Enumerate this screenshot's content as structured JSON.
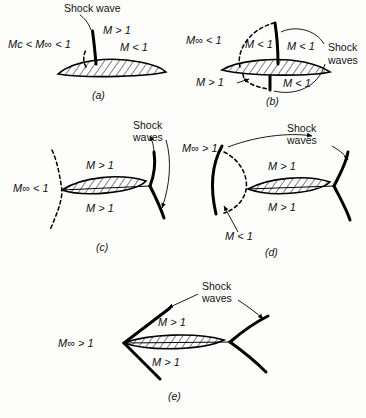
{
  "figure": {
    "background_color": "#fdfdfc",
    "ink_color": "#111111"
  },
  "panels": [
    {
      "id": "a",
      "caption": "(a)",
      "freestream_label": "Mᴄ < M∞ < 1",
      "annotations": [
        {
          "name": "shock-wave-label",
          "text": "Shock wave"
        },
        {
          "name": "supersonic-pocket-label",
          "text": "M > 1"
        },
        {
          "name": "subsonic-aft-label",
          "text": "M < 1"
        }
      ],
      "features": [
        "upper-surface-shock",
        "embedded-supersonic-pocket",
        "sonic-line"
      ]
    },
    {
      "id": "b",
      "caption": "(b)",
      "freestream_label": "M∞ < 1",
      "annotations": [
        {
          "name": "shock-waves-label",
          "text": "Shock waves"
        },
        {
          "name": "upper-pocket-label",
          "text": "M < 1"
        },
        {
          "name": "upper-aft-label",
          "text": "M < 1"
        },
        {
          "name": "lower-pocket-label",
          "text": "M > 1"
        },
        {
          "name": "lower-aft-label",
          "text": "M < 1"
        }
      ],
      "features": [
        "upper-surface-shock",
        "lower-surface-shock",
        "larger-supersonic-pockets",
        "sonic-line"
      ]
    },
    {
      "id": "c",
      "caption": "(c)",
      "freestream_label": "M∞ < 1",
      "annotations": [
        {
          "name": "shock-waves-label",
          "text": "Shock waves"
        },
        {
          "name": "upper-supersonic-label",
          "text": "M > 1"
        },
        {
          "name": "lower-supersonic-label",
          "text": "M > 1"
        }
      ],
      "features": [
        "trailing-edge-shocks",
        "detached-sonic-line-ahead",
        "fully-supersonic-surfaces"
      ]
    },
    {
      "id": "d",
      "caption": "(d)",
      "freestream_label": "M∞ > 1",
      "annotations": [
        {
          "name": "shock-waves-label",
          "text": "Shock waves"
        },
        {
          "name": "upper-supersonic-label",
          "text": "M > 1"
        },
        {
          "name": "lower-supersonic-label",
          "text": "M > 1"
        },
        {
          "name": "subsonic-pocket-label",
          "text": "M < 1"
        }
      ],
      "features": [
        "detached-bow-shock",
        "subsonic-nose-region",
        "trailing-edge-shocks",
        "sonic-line"
      ]
    },
    {
      "id": "e",
      "caption": "(e)",
      "freestream_label": "M∞ > 1",
      "annotations": [
        {
          "name": "shock-waves-label",
          "text": "Shock waves"
        },
        {
          "name": "upper-supersonic-label",
          "text": "M > 1"
        },
        {
          "name": "lower-supersonic-label",
          "text": "M > 1"
        }
      ],
      "features": [
        "attached-oblique-shocks",
        "trailing-edge-shocks",
        "fully-supersonic"
      ]
    }
  ],
  "labels": {
    "shock_wave_singular": "Shock wave",
    "shock_waves_plural_line1": "Shock",
    "shock_waves_plural_line2": "waves",
    "m_gt_1": "M > 1",
    "m_lt_1": "M < 1",
    "minf_lt_1": "M∞ < 1",
    "minf_gt_1": "M∞ > 1",
    "mc_minf_lt_1": "Mᴄ < M∞ < 1",
    "cap_a": "(a)",
    "cap_b": "(b)",
    "cap_c": "(c)",
    "cap_d": "(d)",
    "cap_e": "(e)"
  }
}
